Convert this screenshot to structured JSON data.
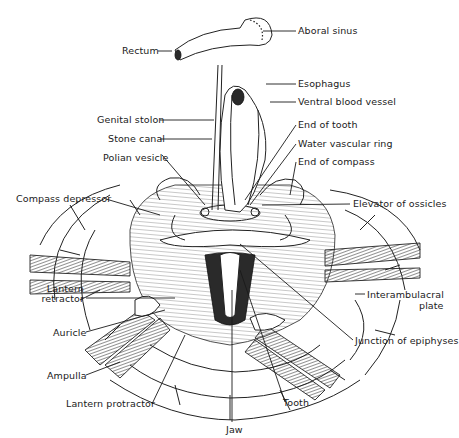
{
  "figure": {
    "labels": {
      "rectum": "Rectum",
      "aboral_sinus": "Aboral sinus",
      "esophagus": "Esophagus",
      "ventral_blood_vessel": "Ventral blood vessel",
      "genital_stolon": "Genital stolon",
      "stone_canal": "Stone canal",
      "end_of_tooth": "End of tooth",
      "water_vascular_ring": "Water vascular ring",
      "polian_vesicle": "Polian vesicle",
      "end_of_compass": "End of compass",
      "compass_depressor": "Compass depressor",
      "elevator_of_ossicles": "Elevator of ossicles",
      "lantern_retractor_1": "Lantern",
      "lantern_retractor_2": "retractor",
      "interambulacral_plate_1": "Interambulacral",
      "interambulacral_plate_2": "plate",
      "auricle": "Auricle",
      "junction_of_epiphyses": "Junction of epiphyses",
      "ampulla": "Ampulla",
      "lantern_protractor": "Lantern protractor",
      "tooth": "Tooth",
      "jaw": "Jaw"
    }
  }
}
